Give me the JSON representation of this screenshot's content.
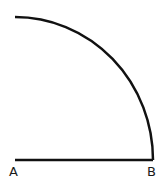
{
  "diagram": {
    "type": "quarter-circle-arc",
    "stroke_color": "#111111",
    "background": "#ffffff",
    "points": {
      "A": {
        "label": "A",
        "x": 15,
        "y": 160
      },
      "B": {
        "label": "B",
        "x": 153,
        "y": 160
      }
    },
    "segment": {
      "from": "A",
      "to": "B"
    },
    "arc": {
      "center": "A",
      "from": "top",
      "to": "B",
      "radius_x": 138,
      "radius_y": 143
    }
  }
}
